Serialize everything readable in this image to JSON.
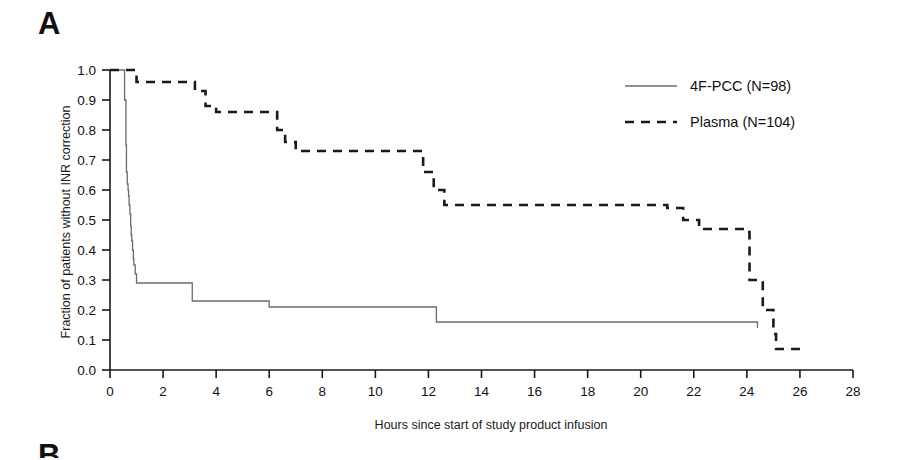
{
  "figure": {
    "panel_label": "A",
    "next_panel_label": "B"
  },
  "chart_data": {
    "type": "line",
    "title": "",
    "subtitle": "",
    "xlabel": "Hours since start of study product infusion",
    "ylabel": "Fraction of patients without INR correction",
    "xlim": [
      0,
      28
    ],
    "ylim": [
      0,
      1.0
    ],
    "xticks": [
      0,
      2,
      4,
      6,
      8,
      10,
      12,
      14,
      16,
      18,
      20,
      22,
      24,
      26,
      28
    ],
    "xtick_labels": [
      "0",
      "2",
      "4",
      "6",
      "8",
      "10",
      "12",
      "14",
      "16",
      "18",
      "20",
      "22",
      "24",
      "26",
      "28"
    ],
    "yticks": [
      0.0,
      0.1,
      0.2,
      0.3,
      0.4,
      0.5,
      0.6,
      0.7,
      0.8,
      0.9,
      1.0
    ],
    "ytick_labels": [
      "0.0",
      "0.1",
      "0.2",
      "0.3",
      "0.4",
      "0.5",
      "0.6",
      "0.7",
      "0.8",
      "0.9",
      "1.0"
    ],
    "grid": false,
    "legend_position": "top-right",
    "step": "post",
    "series": [
      {
        "name": "4F-PCC (N=98)",
        "style": "solid",
        "color": "#6b6b6b",
        "x": [
          0,
          0.5,
          0.55,
          0.6,
          0.62,
          0.65,
          0.68,
          0.7,
          0.72,
          0.75,
          0.78,
          0.8,
          0.82,
          0.85,
          0.88,
          0.9,
          0.95,
          1.0,
          3.0,
          3.1,
          6.0,
          12.0,
          12.3,
          22.3,
          24.4
        ],
        "y": [
          1.0,
          1.0,
          0.9,
          0.75,
          0.66,
          0.62,
          0.6,
          0.58,
          0.55,
          0.52,
          0.48,
          0.45,
          0.43,
          0.4,
          0.37,
          0.35,
          0.32,
          0.29,
          0.29,
          0.23,
          0.21,
          0.21,
          0.16,
          0.16,
          0.14
        ]
      },
      {
        "name": "Plasma (N=104)",
        "style": "dashed",
        "color": "#1a1a1a",
        "x": [
          0,
          0.8,
          1.0,
          2.2,
          3.2,
          3.6,
          4.0,
          6.0,
          6.3,
          6.6,
          7.0,
          11.4,
          11.8,
          12.2,
          12.6,
          15.6,
          21.0,
          21.6,
          22.2,
          23.9,
          24.1,
          24.6,
          25.0,
          25.1,
          26.0
        ],
        "y": [
          1.0,
          1.0,
          0.96,
          0.96,
          0.93,
          0.88,
          0.86,
          0.86,
          0.8,
          0.76,
          0.73,
          0.73,
          0.66,
          0.6,
          0.55,
          0.55,
          0.54,
          0.5,
          0.47,
          0.46,
          0.3,
          0.2,
          0.12,
          0.07,
          0.07
        ]
      }
    ],
    "legend": [
      {
        "label": "4F-PCC (N=98)",
        "style": "solid",
        "color": "#6b6b6b"
      },
      {
        "label": "Plasma (N=104)",
        "style": "dashed",
        "color": "#1a1a1a"
      }
    ]
  }
}
